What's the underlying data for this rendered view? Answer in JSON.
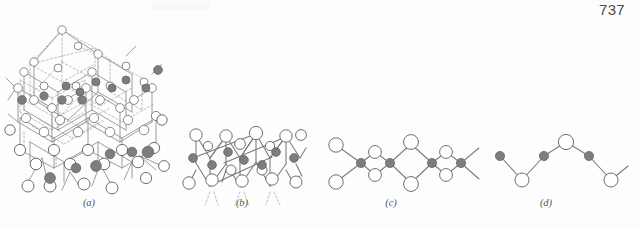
{
  "page": {
    "page_number": "737",
    "background_color": "#fdfdfd"
  },
  "figure": {
    "type": "crystal-structure-diagram",
    "open_circle_color": "#ffffff",
    "open_circle_stroke": "#6e6e6e",
    "filled_circle_color": "#7d7d7d",
    "filled_circle_stroke": "#5e5e5e",
    "bond_color": "#7a7a7a",
    "dashed_bond_color": "#a8a8a8",
    "panels": [
      {
        "id": "a",
        "caption": "(a)",
        "caption_x": 89,
        "caption_y": 201,
        "label": "three-dimensional framework"
      },
      {
        "id": "b",
        "caption": "(b)",
        "caption_x": 242,
        "caption_y": 201,
        "label": "two-dimensional sheet"
      },
      {
        "id": "c",
        "caption": "(c)",
        "caption_x": 391,
        "caption_y": 201,
        "label": "double chain"
      },
      {
        "id": "d",
        "caption": "(d)",
        "caption_x": 546,
        "caption_y": 201,
        "label": "single chain"
      }
    ]
  },
  "chart_data": {
    "type": "diagram",
    "title": "",
    "panels": {
      "c": {
        "filled_nodes": [
          {
            "x": 361,
            "y": 163,
            "r": 4.6
          },
          {
            "x": 390,
            "y": 163,
            "r": 4.6
          },
          {
            "x": 432,
            "y": 163,
            "r": 4.6
          },
          {
            "x": 461,
            "y": 163,
            "r": 4.6
          }
        ],
        "open_nodes": [
          {
            "x": 336,
            "y": 145,
            "r": 7.2
          },
          {
            "x": 336,
            "y": 182,
            "r": 7.2
          },
          {
            "x": 375,
            "y": 152,
            "r": 6.4
          },
          {
            "x": 375,
            "y": 175,
            "r": 6.4
          },
          {
            "x": 411,
            "y": 142,
            "r": 7.4
          },
          {
            "x": 411,
            "y": 184,
            "r": 7.4
          },
          {
            "x": 446,
            "y": 152,
            "r": 6.4
          },
          {
            "x": 446,
            "y": 175,
            "r": 6.4
          }
        ]
      },
      "d": {
        "filled_nodes": [
          {
            "x": 500,
            "y": 156,
            "r": 4.6
          },
          {
            "x": 544,
            "y": 156,
            "r": 4.6
          },
          {
            "x": 589,
            "y": 156,
            "r": 4.6
          }
        ],
        "open_nodes": [
          {
            "x": 522,
            "y": 180,
            "r": 7.0
          },
          {
            "x": 566,
            "y": 142,
            "r": 7.6
          },
          {
            "x": 611,
            "y": 180,
            "r": 7.0
          }
        ]
      }
    }
  }
}
